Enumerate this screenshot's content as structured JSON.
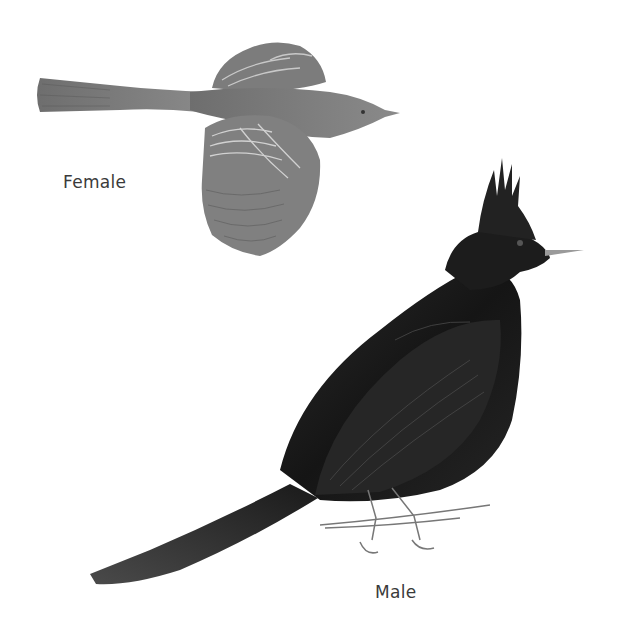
{
  "illustration": {
    "subjects": [
      {
        "id": "female",
        "label": "Female",
        "pose": "in flight, top view",
        "tone": "#7a7a7a"
      },
      {
        "id": "male",
        "label": "Male",
        "pose": "perched on twig, crested",
        "tone": "#1e1e1e"
      }
    ],
    "background": "#ffffff"
  }
}
